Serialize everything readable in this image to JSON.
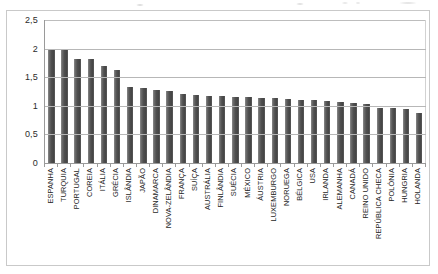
{
  "chart_data": {
    "type": "bar",
    "title": "",
    "subtitle": "",
    "xlabel": "",
    "ylabel": "",
    "ylim": [
      0,
      2.5
    ],
    "yticks": [
      0,
      0.5,
      1,
      1.5,
      2,
      2.5
    ],
    "ytick_labels": [
      "0",
      "0,5",
      "1",
      "1,5",
      "2",
      "2,5"
    ],
    "grid": true,
    "legend": null,
    "decimal_separator": ",",
    "bar_color": "#4f4f4f",
    "categories": [
      "ESPANHA",
      "TURQUIA",
      "PORTUGAL",
      "COREIA",
      "ITÁLIA",
      "GRÉCIA",
      "ISLÂNDIA",
      "JAPÃO",
      "DINAMARCA",
      "NOVA-ZELÂNDIA",
      "FRANÇA",
      "SUÍÇA",
      "AUSTRÁLIA",
      "FINLÂNDIA",
      "SUÉCIA",
      "MÉXICO",
      "ÁUSTRIA",
      "LUXEMBURGO",
      "NORUEGA",
      "BÉLGICA",
      "USA",
      "IRLANDA",
      "ALEMANHA",
      "CANADÁ",
      "REINO UNIDO",
      "REPÚBLICA CHECA",
      "POLÓNIA",
      "HUNGRIA",
      "HOLANDA"
    ],
    "values": [
      2.0,
      1.99,
      1.82,
      1.82,
      1.7,
      1.63,
      1.33,
      1.32,
      1.27,
      1.26,
      1.2,
      1.19,
      1.18,
      1.17,
      1.16,
      1.15,
      1.14,
      1.13,
      1.12,
      1.11,
      1.1,
      1.08,
      1.07,
      1.05,
      1.04,
      0.97,
      0.96,
      0.95,
      0.87
    ]
  }
}
